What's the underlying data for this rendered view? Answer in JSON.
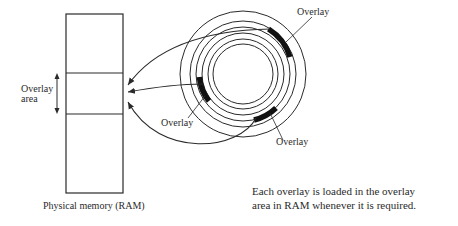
{
  "diagram": {
    "ram": {
      "caption": "Physical memory (RAM)",
      "overlay_area_label_line1": "Overlay",
      "overlay_area_label_line2": "area"
    },
    "disk": {
      "overlay_labels": [
        "Overlay",
        "Overlay",
        "Overlay"
      ]
    },
    "caption_line1": "Each overlay is loaded in the overlay",
    "caption_line2": "area in RAM whenever it is required.",
    "colors": {
      "stroke": "#2a2a2a",
      "fill_block": "#111111",
      "background": "#ffffff"
    }
  }
}
